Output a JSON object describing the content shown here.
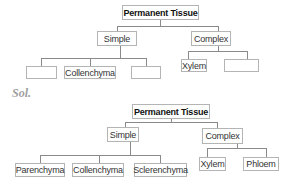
{
  "question_tree": {
    "root": "Permanent Tissue",
    "simple": {
      "label": "Simple",
      "children": [
        "",
        "Collenchyma",
        ""
      ]
    },
    "complex": {
      "label": "Complex",
      "children": [
        "Xylem",
        ""
      ]
    }
  },
  "solution_label": "Sol.",
  "solution_tree": {
    "root": "Permanent Tissue",
    "simple": {
      "label": "Simple",
      "children": [
        "Parenchyma",
        "Collenchyma",
        "Sclerenchyma"
      ]
    },
    "complex": {
      "label": "Complex",
      "children": [
        "Xylem",
        "Phloem"
      ]
    }
  }
}
